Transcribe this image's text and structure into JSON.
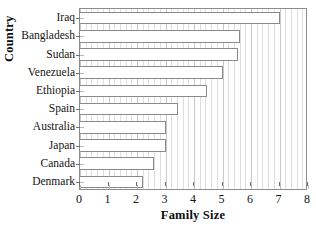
{
  "chart_data": {
    "type": "bar",
    "orientation": "horizontal",
    "title": "",
    "xlabel": "Family Size",
    "ylabel": "Country",
    "xlim": [
      0,
      8
    ],
    "xticks": [
      0,
      1,
      2,
      3,
      4,
      5,
      6,
      7,
      8
    ],
    "grid": true,
    "grid_axis": "x",
    "legend": null,
    "categories": [
      "Iraq",
      "Bangladesh",
      "Sudan",
      "Venezuela",
      "Ethiopia",
      "Spain",
      "Australia",
      "Japan",
      "Canada",
      "Denmark"
    ],
    "values": [
      7.0,
      5.6,
      5.55,
      5.0,
      4.45,
      3.45,
      3.0,
      3.0,
      2.6,
      2.2
    ],
    "bar_face_color": "#ffffff",
    "bar_edge_color": "#8a8a8a",
    "frame_color": "#8d8d8d",
    "gridline_color": "#dededc"
  },
  "artifact": {
    "top_cut_text": "· ·   · ·  ·   ·          ·      ·"
  }
}
